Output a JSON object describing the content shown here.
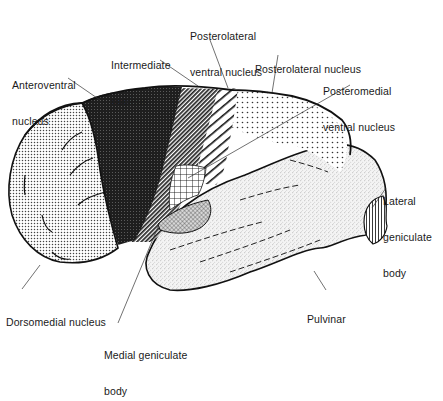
{
  "diagram": {
    "colors": {
      "outline": "#111111",
      "leader": "#333333",
      "background": "#ffffff",
      "anteroventral_fill": "#1e1e1e",
      "pulvinar_stipple": "#8a8a8a"
    },
    "labels": [
      {
        "id": "anteroventral",
        "line1": "Anteroventral",
        "line2": "nucleus",
        "x": 12,
        "y": 55
      },
      {
        "id": "intermediate",
        "line1": "Intermediate",
        "line2": "nucleus",
        "x": 111,
        "y": 35
      },
      {
        "id": "posterolateral-ventral",
        "line1": "Posterolateral",
        "line2": "ventral nucleus",
        "x": 190,
        "y": 6
      },
      {
        "id": "posterolateral",
        "line1": "Posterolateral nucleus",
        "line2": "",
        "x": 255,
        "y": 39
      },
      {
        "id": "posteromedial-ventral",
        "line1": "Posteromedial",
        "line2": "ventral nucleus",
        "x": 323,
        "y": 61
      },
      {
        "id": "lateral-geniculate",
        "line1": "Lateral",
        "line2": "geniculate",
        "line3": "body",
        "x": 383,
        "y": 171
      },
      {
        "id": "pulvinar",
        "line1": "Pulvinar",
        "line2": "",
        "x": 307,
        "y": 289
      },
      {
        "id": "dorsomedial",
        "line1": "Dorsomedial nucleus",
        "line2": "",
        "x": 6,
        "y": 292
      },
      {
        "id": "medial-geniculate",
        "line1": "Medial geniculate",
        "line2": "body",
        "x": 104,
        "y": 325
      }
    ]
  }
}
